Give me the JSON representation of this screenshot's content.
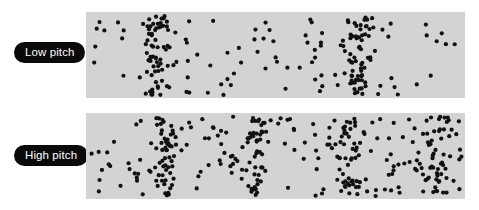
{
  "figure": {
    "background_color": "#ffffff",
    "width": 479,
    "height": 210
  },
  "rows": [
    {
      "id": "low-pitch",
      "label": "Low pitch",
      "label_badge_color": "#0a0a0a",
      "label_text_color": "#ffffff",
      "panel_color": "#d3d3d3",
      "dot_color": "#111111"
    },
    {
      "id": "high-pitch",
      "label": "High pitch",
      "label_badge_color": "#0a0a0a",
      "label_text_color": "#ffffff",
      "panel_color": "#d3d3d3",
      "dot_color": "#111111"
    }
  ],
  "chart_data": {
    "type": "scatter",
    "xlabel": "",
    "ylabel": "",
    "grid": false,
    "legend": "none",
    "panel_width": 379,
    "panel_height": 86,
    "dot_radius": 2.1,
    "series": [
      {
        "name": "Low pitch",
        "compression_count": 2,
        "compression_centers_px": [
          72,
          272
        ],
        "compression_sigma_px": 16,
        "wavelength_px": 200,
        "dot_count": 210,
        "background_density": 0.45,
        "seed": 1207
      },
      {
        "name": "High pitch",
        "compression_count": 4,
        "compression_centers_px": [
          80,
          168,
          262,
          352
        ],
        "compression_sigma_px": 17,
        "wavelength_px": 92,
        "dot_count": 330,
        "background_density": 0.5,
        "seed": 4493
      }
    ]
  }
}
